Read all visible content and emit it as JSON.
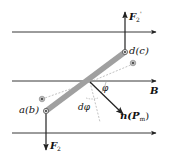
{
  "figure": {
    "colors": {
      "lines": "#222222",
      "coil": "#a0a0a0",
      "dashed": "#999999"
    }
  },
  "labels": {
    "field": "B",
    "force_top_main": "F",
    "force_top_sub": "2",
    "force_top_prime": "'",
    "force_bottom_main": "F",
    "force_bottom_sub": "2",
    "corner_top": "d(c)",
    "corner_bottom": "a(b)",
    "angle": "φ",
    "angle_increment": "dφ",
    "normal_main": "n(P",
    "normal_sub": "m",
    "normal_close": ")"
  },
  "field_lines": [
    {
      "y": 32
    },
    {
      "y": 81
    },
    {
      "y": 133
    }
  ]
}
